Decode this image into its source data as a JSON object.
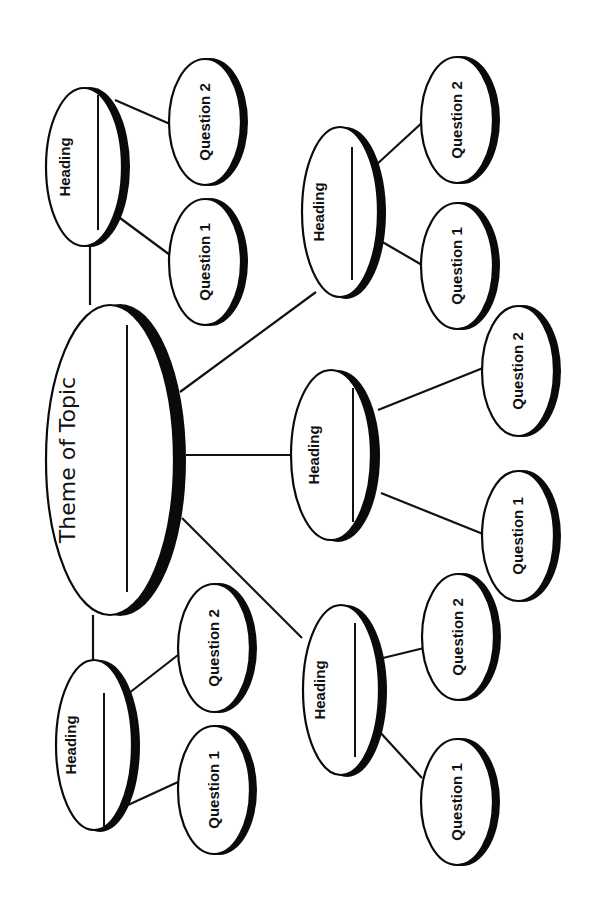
{
  "diagram": {
    "type": "concept-map",
    "orientation": "rotated-90-ccw",
    "colors": {
      "ink": "#0a0a0a",
      "background": "#ffffff"
    },
    "center": {
      "label": "Theme of Topic",
      "has_write_line": true
    },
    "branches": [
      {
        "id": "top-left",
        "heading": "Heading",
        "has_write_line": true,
        "questions": [
          "Question 1",
          "Question 2"
        ]
      },
      {
        "id": "top-right",
        "heading": "Heading",
        "has_write_line": true,
        "questions": [
          "Question 1",
          "Question 2"
        ]
      },
      {
        "id": "middle",
        "heading": "Heading",
        "has_write_line": true,
        "questions": [
          "Question 1",
          "Question 2"
        ]
      },
      {
        "id": "bottom-right",
        "heading": "Heading",
        "has_write_line": true,
        "questions": [
          "Question 1",
          "Question 2"
        ]
      },
      {
        "id": "bottom-left",
        "heading": "Heading",
        "has_write_line": true,
        "questions": [
          "Question 1",
          "Question 2"
        ]
      }
    ]
  }
}
